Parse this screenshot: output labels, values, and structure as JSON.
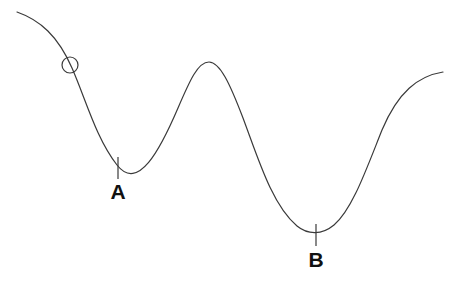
{
  "diagram": {
    "background_color": "#ffffff",
    "canvas": {
      "width": 449,
      "height": 283
    },
    "curve": {
      "name": "wavy-surface-curve",
      "color": "#3a3a3a",
      "stroke_width": 1.2,
      "path": "M 17 12 C 40 20, 58 36, 72 68 C 86 100, 96 138, 117 165 C 138 192, 160 150, 178 108 C 190 80, 198 62, 209 62 C 220 62, 230 84, 243 118 C 258 158, 272 205, 297 226 C 308 235, 322 235, 334 225 C 352 210, 366 170, 382 130 C 398 92, 418 76, 443 72",
      "description": "Descending left slope, valley A, central peak, descent to valley B, rising right slope"
    },
    "ball": {
      "name": "ball",
      "center_x": 70,
      "center_y": 65,
      "radius": 8,
      "color": "#3a3a3a",
      "stroke_width": 1.2,
      "fill": "none"
    },
    "markers": [
      {
        "id": "A",
        "label": "A",
        "tick_x": 118,
        "tick_y_top": 157,
        "tick_y_bottom": 179,
        "label_x": 118,
        "label_y": 199,
        "font_size": 21,
        "color": "#111111",
        "tick_color": "#3a3a3a"
      },
      {
        "id": "B",
        "label": "B",
        "tick_x": 316,
        "tick_y_top": 224,
        "tick_y_bottom": 246,
        "label_x": 316,
        "label_y": 267,
        "font_size": 21,
        "color": "#111111",
        "tick_color": "#3a3a3a"
      }
    ]
  }
}
